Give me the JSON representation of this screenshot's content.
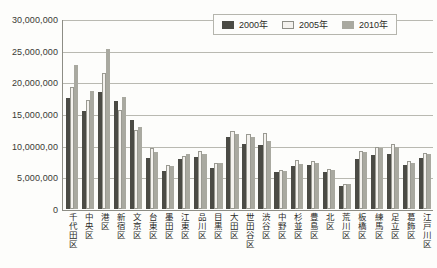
{
  "chart_data": {
    "type": "bar",
    "title": "",
    "xlabel": "",
    "ylabel": "",
    "ylim": [
      0,
      30000000
    ],
    "grid": true,
    "legend_position": "top-right",
    "y_tick_labels": [
      "30,000,000",
      "25,000,000",
      "20,000,000",
      "15,000,000",
      "10,0000,00",
      "5,000,000",
      "0"
    ],
    "y_tick_values": [
      30000000,
      25000000,
      20000000,
      15000000,
      10000000,
      5000000,
      0
    ],
    "categories": [
      "千代田区",
      "中央区",
      "港区",
      "新宿区",
      "文京区",
      "台東区",
      "墨田区",
      "江東区",
      "品川区",
      "目黒区",
      "大田区",
      "世田谷区",
      "渋谷区",
      "中野区",
      "杉並区",
      "豊島区",
      "北区",
      "荒川区",
      "板橋区",
      "練馬区",
      "足立区",
      "葛飾区",
      "江戸川区"
    ],
    "series": [
      {
        "name": "2000年",
        "color": "#4b4b45",
        "values": [
          17600000,
          15400000,
          18500000,
          17100000,
          14000000,
          8000000,
          6000000,
          7900000,
          8200000,
          6400000,
          11400000,
          10200000,
          10100000,
          5800000,
          6800000,
          7000000,
          5900000,
          3600000,
          7900000,
          8600000,
          8700000,
          7000000,
          8000000
        ]
      },
      {
        "name": "2005年",
        "color": "#f4f2ee",
        "values": [
          19300000,
          17200000,
          21500000,
          15700000,
          12400000,
          9600000,
          6900000,
          8300000,
          9200000,
          7300000,
          12300000,
          11900000,
          12000000,
          6100000,
          7800000,
          7600000,
          6300000,
          4000000,
          9200000,
          9800000,
          10200000,
          7600000,
          8900000
        ]
      },
      {
        "name": "2010年",
        "color": "#a9a9a0",
        "values": [
          22700000,
          18600000,
          25200000,
          17700000,
          13000000,
          9000000,
          6800000,
          8700000,
          8700000,
          7200000,
          11900000,
          11400000,
          10800000,
          6000000,
          7100000,
          7300000,
          6200000,
          4000000,
          9000000,
          9700000,
          9800000,
          7300000,
          8700000
        ]
      }
    ]
  },
  "legend": {
    "items": [
      {
        "label": "2000年",
        "key": "s2000"
      },
      {
        "label": "2005年",
        "key": "s2005"
      },
      {
        "label": "2010年",
        "key": "s2010"
      }
    ]
  }
}
